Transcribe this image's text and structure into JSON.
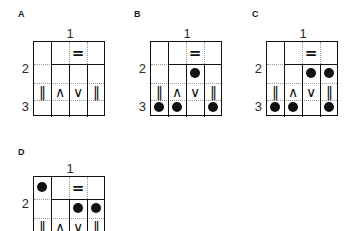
{
  "figure": {
    "type": "diagram",
    "panels": [
      {
        "letter": "A",
        "col_label": "1",
        "row_labels": [
          "2",
          "3"
        ],
        "symbols": [
          "‖",
          "∧",
          "∨",
          "‖"
        ],
        "equals_symbol": "=",
        "equals_column": 3,
        "dots": []
      },
      {
        "letter": "B",
        "col_label": "1",
        "row_labels": [
          "2",
          "3"
        ],
        "symbols": [
          "‖",
          "∧",
          "∨",
          "‖"
        ],
        "equals_symbol": "=",
        "equals_column": 3,
        "dots": [
          {
            "row": 2,
            "col": 3
          },
          {
            "row": 3,
            "col": 1
          },
          {
            "row": 3,
            "col": 2
          },
          {
            "row": 3,
            "col": 4
          }
        ]
      },
      {
        "letter": "C",
        "col_label": "1",
        "row_labels": [
          "2",
          "3"
        ],
        "symbols": [
          "‖",
          "∧",
          "∨",
          "‖"
        ],
        "equals_symbol": "=",
        "equals_column": 3,
        "dots": [
          {
            "row": 2,
            "col": 3
          },
          {
            "row": 2,
            "col": 4
          },
          {
            "row": 3,
            "col": 1
          },
          {
            "row": 3,
            "col": 2
          },
          {
            "row": 3,
            "col": 4
          }
        ]
      },
      {
        "letter": "D",
        "col_label": "1",
        "row_labels": [
          "2"
        ],
        "symbols": [
          "‖",
          "∧",
          "∨",
          "‖"
        ],
        "equals_symbol": "=",
        "equals_column": 3,
        "dots": [
          {
            "row": 1,
            "col": 1
          },
          {
            "row": 2,
            "col": 3
          },
          {
            "row": 2,
            "col": 4
          }
        ]
      }
    ],
    "colors": {
      "ink": "#111111",
      "grid_dotted": "#9a9a9a",
      "background": "#ffffff"
    }
  }
}
